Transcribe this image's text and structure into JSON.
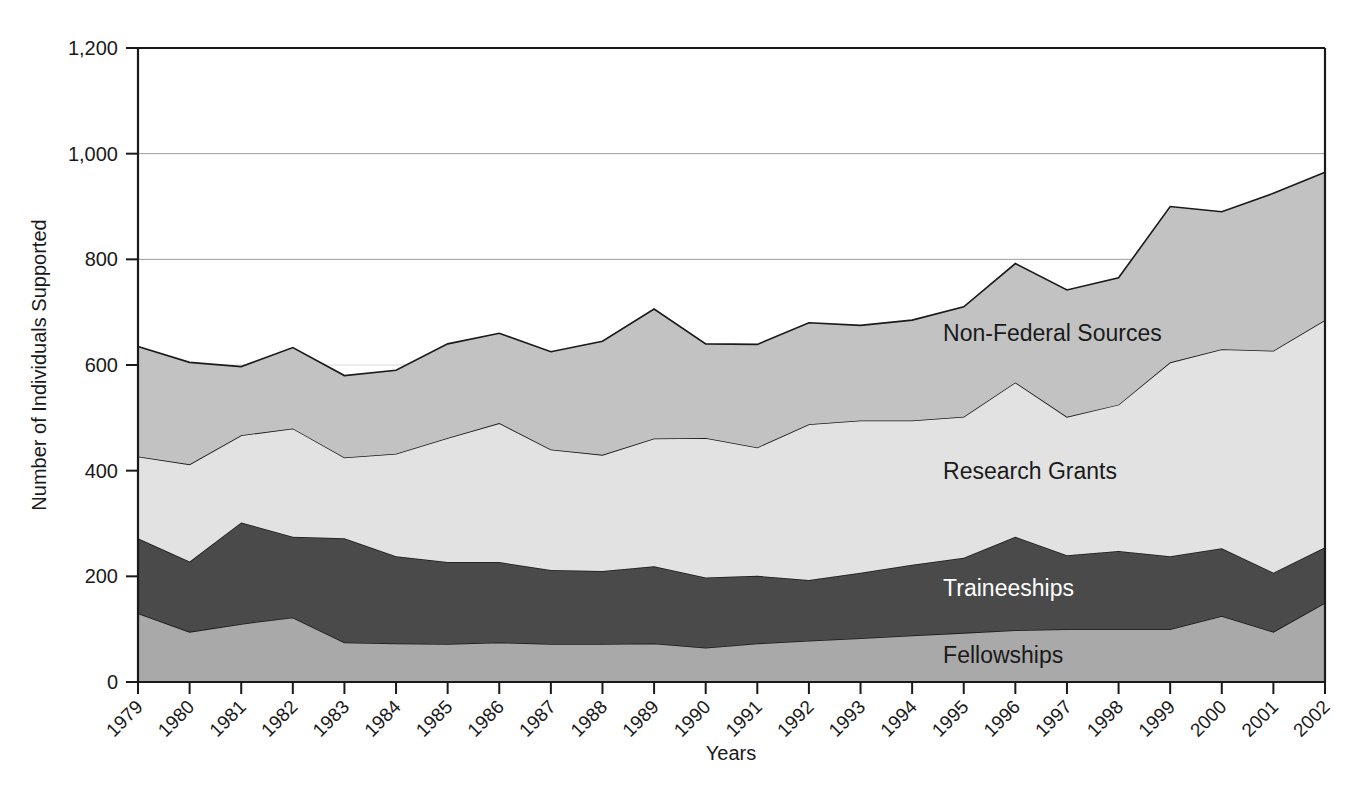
{
  "chart_data": {
    "type": "area",
    "stacked": true,
    "title": "",
    "xlabel": "Years",
    "ylabel": "Number of Individuals Supported",
    "categories": [
      "1979",
      "1980",
      "1981",
      "1982",
      "1983",
      "1984",
      "1985",
      "1986",
      "1987",
      "1988",
      "1989",
      "1990",
      "1991",
      "1992",
      "1993",
      "1994",
      "1995",
      "1996",
      "1997",
      "1998",
      "1999",
      "2000",
      "2001",
      "2002"
    ],
    "x": [
      1979,
      1980,
      1981,
      1982,
      1983,
      1984,
      1985,
      1986,
      1987,
      1988,
      1989,
      1990,
      1991,
      1992,
      1993,
      1994,
      1995,
      1996,
      1997,
      1998,
      1999,
      2000,
      2001,
      2002
    ],
    "ylim": [
      0,
      1200
    ],
    "yticks": [
      0,
      200,
      400,
      600,
      800,
      1000,
      1200
    ],
    "ytick_labels": [
      "0",
      "200",
      "400",
      "600",
      "800",
      "1,000",
      "1,200"
    ],
    "grid": "horizontal-light",
    "legend_position": "inline-labels",
    "series": [
      {
        "name": "Fellowships",
        "color": "#a9a9a9",
        "values": [
          130,
          95,
          110,
          122,
          75,
          73,
          72,
          75,
          72,
          72,
          73,
          65,
          73,
          78,
          83,
          88,
          93,
          98,
          100,
          100,
          100,
          125,
          95,
          150
        ]
      },
      {
        "name": "Traineeships",
        "color": "#4a4a4a",
        "values": [
          142,
          133,
          192,
          153,
          197,
          165,
          155,
          152,
          140,
          138,
          146,
          133,
          128,
          115,
          124,
          134,
          142,
          177,
          140,
          148,
          138,
          128,
          112,
          105
        ]
      },
      {
        "name": "Research Grants",
        "color": "#e2e2e2",
        "values": [
          155,
          184,
          165,
          205,
          153,
          194,
          235,
          263,
          228,
          220,
          242,
          264,
          243,
          295,
          288,
          273,
          267,
          292,
          262,
          277,
          367,
          377,
          420,
          430
        ]
      },
      {
        "name": "Non-Federal Sources",
        "color": "#c2c2c2",
        "values": [
          208,
          193,
          130,
          153,
          155,
          158,
          178,
          170,
          185,
          215,
          245,
          178,
          195,
          192,
          180,
          190,
          208,
          225,
          240,
          240,
          295,
          260,
          298,
          280
        ]
      }
    ],
    "series_totals": [
      635,
      605,
      597,
      633,
      580,
      590,
      640,
      660,
      625,
      645,
      706,
      640,
      639,
      680,
      675,
      685,
      710,
      792,
      742,
      765,
      900,
      890,
      925,
      965
    ],
    "cumulative": {
      "fellowships_top": [
        130,
        95,
        110,
        122,
        75,
        73,
        72,
        75,
        72,
        72,
        73,
        65,
        73,
        78,
        83,
        88,
        93,
        98,
        100,
        100,
        100,
        125,
        95,
        150
      ],
      "traineeships_top": [
        272,
        228,
        302,
        275,
        272,
        238,
        227,
        227,
        212,
        210,
        219,
        198,
        201,
        193,
        207,
        222,
        235,
        275,
        240,
        248,
        238,
        253,
        207,
        255
      ],
      "research_grants_top": [
        427,
        412,
        467,
        480,
        425,
        432,
        462,
        490,
        440,
        430,
        461,
        462,
        444,
        488,
        495,
        495,
        502,
        567,
        502,
        525,
        605,
        630,
        627,
        685
      ],
      "non_federal_top": [
        635,
        605,
        597,
        633,
        580,
        590,
        640,
        660,
        625,
        645,
        706,
        640,
        639,
        680,
        675,
        685,
        710,
        792,
        742,
        765,
        900,
        890,
        925,
        965
      ]
    },
    "annotations": [
      {
        "text": "Non-Federal Sources",
        "value_x": 1994.6,
        "value_y": 660
      },
      {
        "text": "Research Grants",
        "value_x": 1994.6,
        "value_y": 400
      },
      {
        "text": "Traineeships",
        "value_x": 1994.6,
        "value_y": 178
      },
      {
        "text": "Fellowships",
        "value_x": 1994.6,
        "value_y": 52
      }
    ]
  },
  "axes": {
    "y_title": "Number of Individuals Supported",
    "x_title": "Years"
  }
}
